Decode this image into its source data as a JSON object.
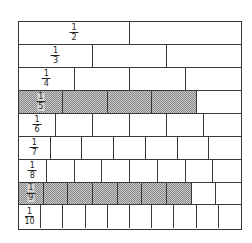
{
  "diagram": {
    "title": "",
    "type": "fraction-wall",
    "rows": [
      {
        "denominator": 2,
        "label_num": "1",
        "label_den": "2",
        "shaded": 0
      },
      {
        "denominator": 3,
        "label_num": "1",
        "label_den": "3",
        "shaded": 0
      },
      {
        "denominator": 4,
        "label_num": "1",
        "label_den": "4",
        "shaded": 0
      },
      {
        "denominator": 5,
        "label_num": "1",
        "label_den": "5",
        "shaded": 4
      },
      {
        "denominator": 6,
        "label_num": "1",
        "label_den": "6",
        "shaded": 0
      },
      {
        "denominator": 7,
        "label_num": "1",
        "label_den": "7",
        "shaded": 0
      },
      {
        "denominator": 8,
        "label_num": "1",
        "label_den": "8",
        "shaded": 0
      },
      {
        "denominator": 9,
        "label_num": "1",
        "label_den": "9",
        "shaded": 7
      },
      {
        "denominator": 10,
        "label_num": "1",
        "label_den": "10",
        "shaded": 0
      }
    ],
    "colors": {
      "line": "#3a3a3a",
      "shade_light": "#c9c9c9",
      "shade_dark": "#888888",
      "background": "#ffffff"
    }
  }
}
